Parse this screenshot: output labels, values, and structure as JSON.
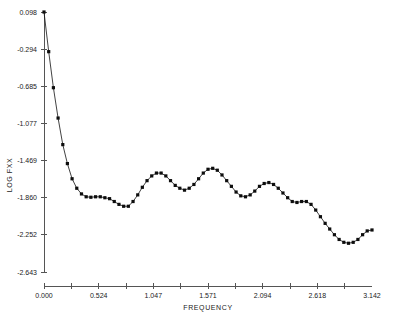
{
  "chart_data": {
    "type": "line",
    "title": "",
    "xlabel": "FREQUENCY",
    "ylabel": "LOG FXX",
    "xlim": [
      0.0,
      3.142
    ],
    "ylim": [
      -2.643,
      0.098
    ],
    "grid": false,
    "legend": null,
    "marker": "filled-square",
    "xticks": [
      0.0,
      0.524,
      1.047,
      1.571,
      2.094,
      2.618,
      3.142
    ],
    "xtick_labels": [
      "0.000",
      "0.524",
      "1.047",
      "1.571",
      "2.094",
      "2.618",
      "3.142"
    ],
    "yticks": [
      0.098,
      -0.294,
      -0.685,
      -1.077,
      -1.469,
      -1.86,
      -2.252,
      -2.643
    ],
    "ytick_labels": [
      "0.098",
      "-0.294",
      "-0.685",
      "-1.077",
      "-1.469",
      "-1.860",
      "-2.252",
      "-2.643"
    ],
    "x": [
      0.0,
      0.045,
      0.09,
      0.135,
      0.18,
      0.224,
      0.269,
      0.314,
      0.359,
      0.404,
      0.449,
      0.494,
      0.539,
      0.583,
      0.628,
      0.673,
      0.718,
      0.763,
      0.808,
      0.853,
      0.898,
      0.942,
      0.987,
      1.032,
      1.077,
      1.122,
      1.167,
      1.212,
      1.257,
      1.301,
      1.346,
      1.391,
      1.436,
      1.481,
      1.526,
      1.571,
      1.616,
      1.66,
      1.705,
      1.75,
      1.795,
      1.84,
      1.885,
      1.93,
      1.975,
      2.019,
      2.064,
      2.109,
      2.154,
      2.199,
      2.244,
      2.289,
      2.334,
      2.378,
      2.423,
      2.468,
      2.513,
      2.558,
      2.603,
      2.648,
      2.693,
      2.737,
      2.782,
      2.827,
      2.872,
      2.917,
      2.962,
      3.007,
      3.052,
      3.096,
      3.142
    ],
    "y": [
      0.098,
      -0.32,
      -0.7,
      -1.02,
      -1.3,
      -1.5,
      -1.66,
      -1.76,
      -1.82,
      -1.85,
      -1.855,
      -1.85,
      -1.85,
      -1.86,
      -1.87,
      -1.9,
      -1.93,
      -1.95,
      -1.95,
      -1.9,
      -1.83,
      -1.75,
      -1.68,
      -1.63,
      -1.6,
      -1.6,
      -1.63,
      -1.68,
      -1.73,
      -1.76,
      -1.78,
      -1.76,
      -1.72,
      -1.66,
      -1.6,
      -1.56,
      -1.55,
      -1.57,
      -1.62,
      -1.68,
      -1.74,
      -1.8,
      -1.84,
      -1.85,
      -1.83,
      -1.79,
      -1.74,
      -1.71,
      -1.7,
      -1.72,
      -1.76,
      -1.81,
      -1.86,
      -1.9,
      -1.91,
      -1.9,
      -1.9,
      -1.93,
      -1.99,
      -2.06,
      -2.13,
      -2.19,
      -2.25,
      -2.3,
      -2.33,
      -2.34,
      -2.33,
      -2.3,
      -2.25,
      -2.21,
      -2.2
    ]
  },
  "axes": {
    "x_title": "FREQUENCY",
    "y_title": "LOG FXX"
  }
}
